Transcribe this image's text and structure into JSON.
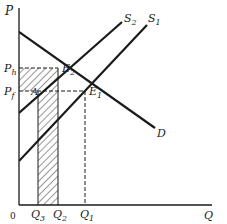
{
  "diagram": {
    "type": "supply-demand",
    "axes": {
      "y_label": "P",
      "x_label": "Q",
      "origin_label": "0"
    },
    "curves": [
      {
        "id": "D",
        "label": "D"
      },
      {
        "id": "S1",
        "label": "S1",
        "label_main": "S",
        "label_sub": "1"
      },
      {
        "id": "S2",
        "label": "S2",
        "label_main": "S",
        "label_sub": "2"
      }
    ],
    "points": [
      {
        "id": "E1",
        "label_main": "E",
        "label_sub": "1"
      },
      {
        "id": "E2",
        "label_main": "E",
        "label_sub": "2"
      },
      {
        "id": "A",
        "label_main": "A"
      }
    ],
    "price_levels": [
      {
        "id": "Ph",
        "label_main": "P",
        "label_sub": "h"
      },
      {
        "id": "Pf",
        "label_main": "P",
        "label_sub": "f"
      }
    ],
    "quantity_levels": [
      {
        "id": "Q3",
        "label_main": "Q",
        "label_sub": "3"
      },
      {
        "id": "Q2",
        "label_main": "Q",
        "label_sub": "2"
      },
      {
        "id": "Q1",
        "label_main": "Q",
        "label_sub": "1"
      }
    ],
    "shaded_regions": [
      "rectangle 0-Q2 between Pf and Ph",
      "rectangle Q3-Q2 below Pf"
    ],
    "colors": {
      "line": "#1a1a1a",
      "background": "#ffffff"
    }
  }
}
